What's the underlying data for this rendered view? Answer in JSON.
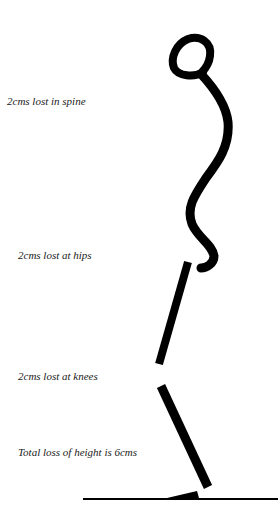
{
  "labels": {
    "spine": "2cms lost in spine",
    "hips": "2cms lost at hips",
    "knees": "2cms lost at knees",
    "total": "Total loss of height is 6cms"
  },
  "colors": {
    "ink": "#000000",
    "text": "#1a1a1a",
    "background": "#ffffff"
  }
}
